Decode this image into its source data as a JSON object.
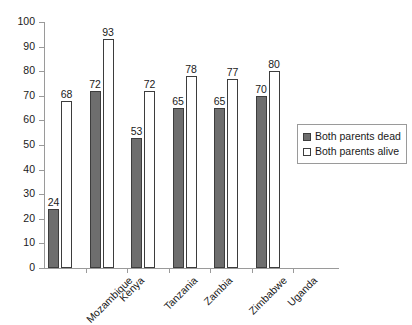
{
  "chart_data": {
    "type": "bar",
    "title": "",
    "subtitle": "",
    "xlabel": "",
    "ylabel": "",
    "ylim": [
      0,
      100
    ],
    "ytick_step": 10,
    "yticks": [
      100,
      90,
      80,
      70,
      60,
      50,
      40,
      30,
      20,
      10,
      0
    ],
    "grid": false,
    "legend_position": "right",
    "categories": [
      "Mozambique",
      "Kenya",
      "Tanzania",
      "Zambia",
      "Zimbabwe",
      "Uganda"
    ],
    "series": [
      {
        "name": "Both parents dead",
        "color": "#6e6e6e",
        "values": [
          24,
          72,
          53,
          65,
          65,
          70
        ]
      },
      {
        "name": "Both parents alive",
        "color": "#ffffff",
        "values": [
          68,
          93,
          72,
          78,
          77,
          80
        ]
      }
    ]
  },
  "legend": {
    "entries": [
      {
        "label": "Both parents dead",
        "swatch": "filled-gray-square-icon"
      },
      {
        "label": "Both parents alive",
        "swatch": "empty-white-square-icon"
      }
    ]
  }
}
